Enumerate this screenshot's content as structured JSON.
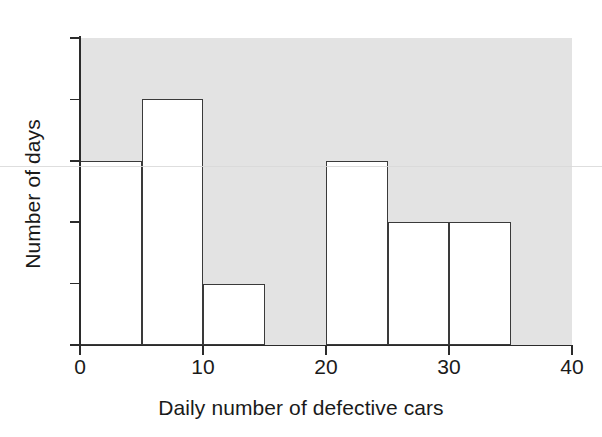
{
  "chart_data": {
    "type": "bar",
    "title": "",
    "subtitle": "",
    "xlabel": "Daily number of defective cars",
    "ylabel": "Number of days",
    "xlim": [
      0,
      40
    ],
    "ylim": [
      0,
      5
    ],
    "bin_width": 5,
    "grid": false,
    "legend": "none",
    "plot_background_color": "#e3e3e3",
    "bar_fill_color": "#ffffff",
    "bar_edge_color": "#3a3a3a",
    "axis_color": "#2b2b2b",
    "x_tick_labels": [
      "0",
      "10",
      "20",
      "30",
      "40"
    ],
    "x_tick_values": [
      0,
      10,
      20,
      30,
      40
    ],
    "y_tick_labels": [
      "0",
      "1",
      "2",
      "3",
      "4",
      "5"
    ],
    "y_tick_values": [
      0,
      1,
      2,
      3,
      4,
      5
    ],
    "categories": [
      "0-5",
      "5-10",
      "10-15",
      "15-20",
      "20-25",
      "25-30",
      "30-35",
      "35-40"
    ],
    "bin_edges": [
      0,
      5,
      10,
      15,
      20,
      25,
      30,
      35,
      40
    ],
    "values": [
      3,
      4,
      1,
      0,
      3,
      2,
      2,
      0
    ],
    "bars": [
      {
        "label": "0-5",
        "x0": 0,
        "x1": 5,
        "value": 3
      },
      {
        "label": "5-10",
        "x0": 5,
        "x1": 10,
        "value": 4
      },
      {
        "label": "10-15",
        "x0": 10,
        "x1": 15,
        "value": 1
      },
      {
        "label": "15-20",
        "x0": 15,
        "x1": 20,
        "value": 0
      },
      {
        "label": "20-25",
        "x0": 20,
        "x1": 25,
        "value": 3
      },
      {
        "label": "25-30",
        "x0": 25,
        "x1": 30,
        "value": 2
      },
      {
        "label": "30-35",
        "x0": 30,
        "x1": 35,
        "value": 2
      },
      {
        "label": "35-40",
        "x0": 35,
        "x1": 40,
        "value": 0
      }
    ]
  }
}
